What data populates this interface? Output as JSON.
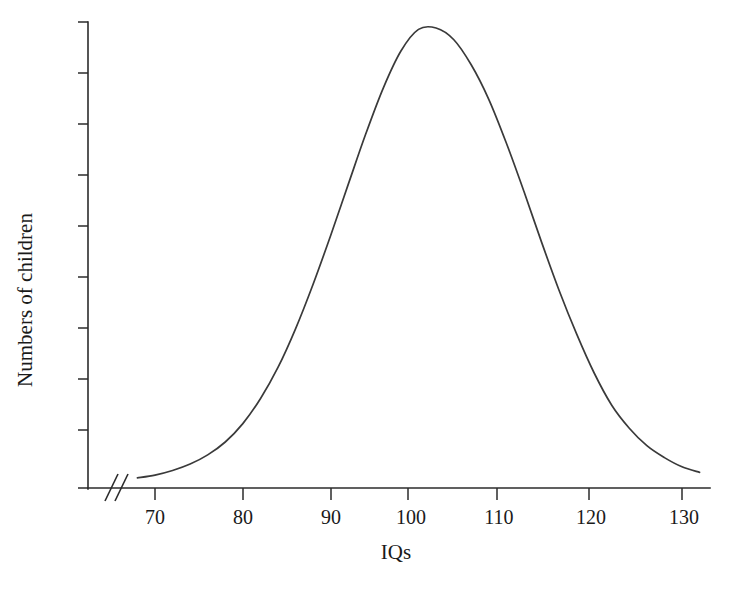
{
  "chart_data": {
    "type": "line",
    "title": "",
    "subtitle": "",
    "xlabel": "IQs",
    "ylabel": "Numbers of children",
    "distribution": "normal",
    "xlim": [
      66,
      133
    ],
    "ylim": [
      0,
      1
    ],
    "grid": false,
    "legend": null,
    "axis_break": "//",
    "axis_break_note": "x-axis broken between origin and first tick",
    "x_tick_labels": [
      "70",
      "80",
      "90",
      "100",
      "110",
      "120",
      "130"
    ],
    "x_ticks": [
      70,
      80,
      90,
      100,
      110,
      120,
      130
    ],
    "y_tick_labels": [],
    "y_tick_count": 9,
    "mean": 99.5,
    "std_dev": 11.5,
    "x": [
      68,
      70,
      72,
      74,
      76,
      78,
      80,
      82,
      84,
      86,
      88,
      90,
      92,
      94,
      96,
      98,
      100,
      102,
      104,
      106,
      108,
      110,
      112,
      114,
      116,
      118,
      120,
      122,
      124,
      126,
      128,
      130,
      132
    ],
    "values": [
      0.022,
      0.028,
      0.038,
      0.052,
      0.072,
      0.1,
      0.14,
      0.194,
      0.262,
      0.346,
      0.443,
      0.549,
      0.66,
      0.77,
      0.87,
      0.95,
      0.997,
      1.0,
      0.975,
      0.92,
      0.845,
      0.75,
      0.645,
      0.535,
      0.43,
      0.335,
      0.25,
      0.18,
      0.13,
      0.092,
      0.066,
      0.046,
      0.034
    ],
    "peak_x": 100,
    "peak_label": "",
    "series": [
      {
        "name": "Numbers of children",
        "color": "#3a3a3a"
      }
    ],
    "colors": {
      "curve": "#3a3a3a",
      "axis": "#2b2b2b",
      "background": "#ffffff",
      "text": "#1a1a1a"
    }
  }
}
